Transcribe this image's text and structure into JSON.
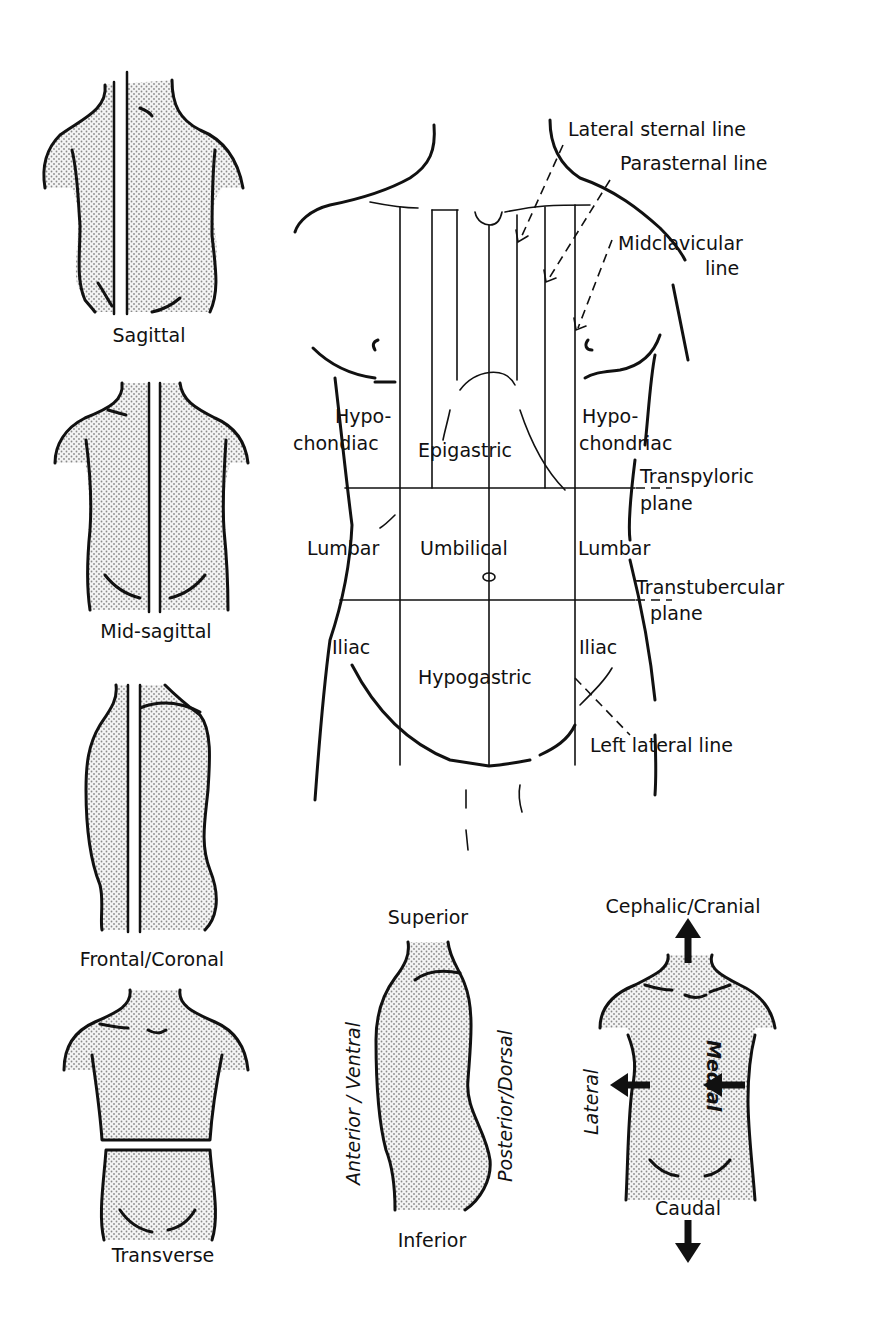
{
  "planes": {
    "sagittal": "Sagittal",
    "mid_sagittal": "Mid-sagittal",
    "frontal": "Frontal/Coronal",
    "transverse": "Transverse"
  },
  "regions_figure": {
    "lines": {
      "lateral_sternal": "Lateral sternal line",
      "parasternal": "Parasternal line",
      "midclavicular_1": "Midclavicular",
      "midclavicular_2": "line",
      "left_lateral": "Left lateral line"
    },
    "planes": {
      "transpyloric_1": "Transpyloric",
      "transpyloric_2": "plane",
      "transtubercular_1": "Transtubercular",
      "transtubercular_2": "plane"
    },
    "regions": {
      "hypo_left_1": "Hypo-",
      "hypo_left_2": "chondiac",
      "epigastric": "Epigastric",
      "hypo_right_1": "Hypo-",
      "hypo_right_2": "chondriac",
      "lumbar_left": "Lumbar",
      "umbilical": "Umbilical",
      "lumbar_right": "Lumbar",
      "iliac_left": "Iliac",
      "hypogastric": "Hypogastric",
      "iliac_right": "Iliac"
    }
  },
  "side_view": {
    "superior": "Superior",
    "inferior": "Inferior",
    "anterior": "Anterior / Ventral",
    "posterior": "Posterior/Dorsal"
  },
  "front_view": {
    "cephalic": "Cephalic/Cranial",
    "caudal": "Caudal",
    "lateral": "Lateral",
    "medial": "Medial"
  }
}
